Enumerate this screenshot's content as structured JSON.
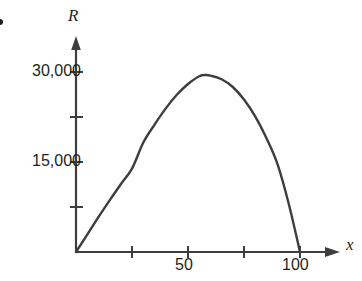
{
  "figure": {
    "background_color": "#ffffff",
    "ink_color": "#3d3d3d",
    "text_color": "#231f20",
    "corner_marker": "bullet-dot"
  },
  "axes": {
    "y_title": "R",
    "x_title": "x",
    "y_tick_labels": [
      "30,000",
      "15,000"
    ],
    "x_tick_labels": [
      "50",
      "100"
    ]
  },
  "chart_data": {
    "type": "line",
    "title": "",
    "xlabel": "x",
    "ylabel": "R",
    "xlim": [
      0,
      118
    ],
    "ylim": [
      0,
      35000
    ],
    "grid": false,
    "legend": "none",
    "x_ticks": [
      0,
      25,
      50,
      75,
      100
    ],
    "x_tick_labels": [
      "",
      "",
      "50",
      "",
      "100"
    ],
    "y_ticks": [
      0,
      7500,
      15000,
      22500,
      30000
    ],
    "y_tick_labels": [
      "",
      "",
      "15,000",
      "",
      "30,000"
    ],
    "annotations": [],
    "series": [
      {
        "name": "R(x)",
        "color": "#3d3d3d",
        "description": "downward parabola with roots at x=0 and x=100, vertex near x=58",
        "x": [
          0,
          5,
          10,
          15,
          20,
          25,
          30,
          35,
          40,
          45,
          50,
          55,
          58,
          60,
          65,
          70,
          75,
          80,
          85,
          90,
          95,
          100
        ],
        "values": [
          0,
          2900,
          5800,
          8600,
          11300,
          13900,
          18200,
          21200,
          23900,
          26200,
          28000,
          29300,
          29500,
          29400,
          28800,
          27500,
          25400,
          22600,
          19000,
          14600,
          8000,
          0
        ]
      }
    ]
  }
}
